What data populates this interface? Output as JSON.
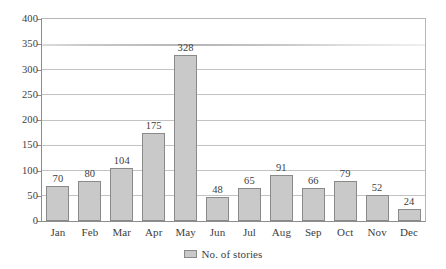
{
  "chart_data": {
    "type": "bar",
    "title": "",
    "subtitle": "",
    "xlabel": "",
    "ylabel": "",
    "categories": [
      "Jan",
      "Feb",
      "Mar",
      "Apr",
      "May",
      "Jun",
      "Jul",
      "Aug",
      "Sep",
      "Oct",
      "Nov",
      "Dec"
    ],
    "series": [
      {
        "name": "No. of stories",
        "values": [
          70,
          80,
          104,
          175,
          328,
          48,
          65,
          91,
          66,
          79,
          52,
          24
        ]
      }
    ],
    "values": [
      70,
      80,
      104,
      175,
      328,
      48,
      65,
      91,
      66,
      79,
      52,
      24
    ],
    "data_labels": [
      "70",
      "80",
      "104",
      "175",
      "328",
      "48",
      "65",
      "91",
      "66",
      "79",
      "52",
      "24"
    ],
    "ylim": [
      0,
      400
    ],
    "ytick_values": [
      0,
      50,
      100,
      150,
      200,
      250,
      300,
      350,
      400
    ],
    "ytick_labels": [
      "0",
      "50",
      "100",
      "150",
      "200",
      "250",
      "300",
      "350",
      "400"
    ],
    "grid": true,
    "grid_axis": "y",
    "legend": {
      "position": "bottom-center",
      "entries": [
        {
          "label": "No. of stories",
          "swatch_name": "legend-swatch-no-of-stories"
        }
      ]
    },
    "colors": {
      "bar_fill": "#c9c9c9",
      "bar_border": "#8a8a8a",
      "gridline": "#c3c3c3",
      "axis": "#8d8d8d",
      "text": "#3d3d3d",
      "background": "#ffffff"
    }
  }
}
